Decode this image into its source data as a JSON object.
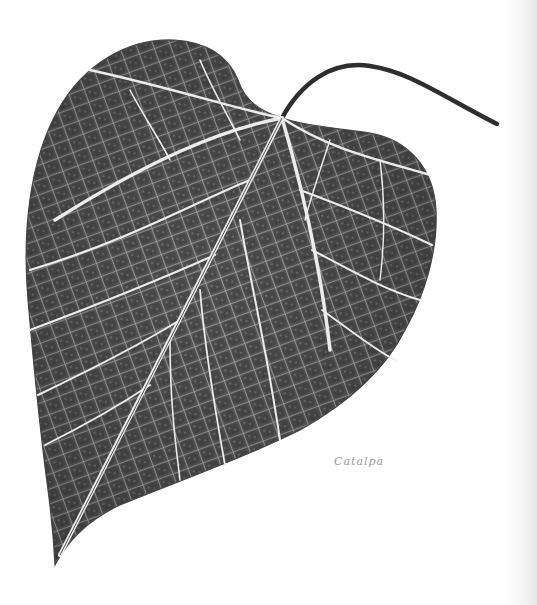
{
  "artwork": {
    "subject": "catalpa-leaf-illustration",
    "style": "graphite botanical drawing",
    "caption": "Catalpa",
    "colors": {
      "paper": "#ffffff",
      "leaf_fill": "#5e5e5e",
      "leaf_dark": "#3d3d3d",
      "vein": "#e8e8e8",
      "stem": "#2e2e2e",
      "caption": "#9a9a9a"
    }
  }
}
